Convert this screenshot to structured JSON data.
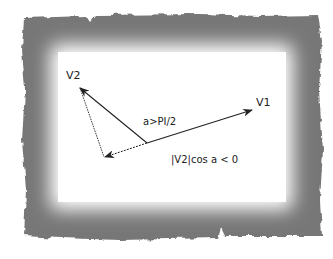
{
  "figure": {
    "frame": {
      "style": "torn-paper",
      "outer_color": "#7a7a7a",
      "inner_color": "#ffffff"
    },
    "vectors": [
      {
        "name": "V1",
        "label": "V1",
        "from": [
          147,
          143
        ],
        "to": [
          252,
          110
        ]
      },
      {
        "name": "V2",
        "label": "V2",
        "from": [
          147,
          143
        ],
        "to": [
          80,
          88
        ]
      }
    ],
    "projection": {
      "label": "|V2|cos a < 0",
      "from": [
        147,
        143
      ],
      "to": [
        105,
        157
      ],
      "perpendicular_from": [
        80,
        88
      ],
      "perpendicular_to": [
        104,
        157
      ]
    },
    "angle_label": "a>PI/2",
    "line_color": "#222222"
  }
}
